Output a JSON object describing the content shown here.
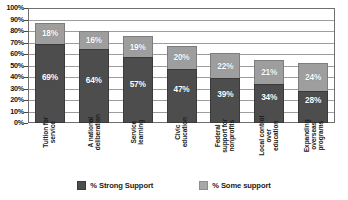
{
  "chart_data": {
    "type": "bar",
    "subtype": "stacked-column",
    "title": "",
    "xlabel": "",
    "ylabel": "",
    "ylim": [
      0,
      100
    ],
    "yticks": [
      "0%",
      "10%",
      "20%",
      "30%",
      "40%",
      "50%",
      "60%",
      "70%",
      "80%",
      "90%",
      "100%"
    ],
    "ytick_values": [
      0,
      10,
      20,
      30,
      40,
      50,
      60,
      70,
      80,
      90,
      100
    ],
    "grid": true,
    "legend_position": "bottom",
    "categories": [
      "Tuition for service",
      "A national deliberation",
      "Service learning",
      "Civic education",
      "Federal support for nonprofits",
      "Local control over education",
      "Expanding overseas programs"
    ],
    "category_lines": [
      [
        "Tuition for",
        "service"
      ],
      [
        "A national",
        "deliberation"
      ],
      [
        "Service",
        "learning"
      ],
      [
        "Civic",
        "education"
      ],
      [
        "Federal",
        "support for",
        "nonprofits"
      ],
      [
        "Local control",
        "over",
        "education"
      ],
      [
        "Expanding",
        "overseas",
        "programs"
      ]
    ],
    "series": [
      {
        "name": "% Strong Support",
        "color": "#4d4d4d",
        "values": [
          69,
          64,
          57,
          47,
          39,
          34,
          28
        ],
        "labels": [
          "69%",
          "64%",
          "57%",
          "47%",
          "39%",
          "34%",
          "28%"
        ]
      },
      {
        "name": "% Some support",
        "color": "#9e9e9e",
        "values": [
          18,
          16,
          19,
          20,
          22,
          21,
          24
        ],
        "labels": [
          "18%",
          "16%",
          "19%",
          "20%",
          "22%",
          "21%",
          "24%"
        ]
      }
    ]
  },
  "legend": {
    "items": [
      {
        "label": "% Strong Support",
        "swatch": "strong"
      },
      {
        "label": "% Some support",
        "swatch": "some"
      }
    ]
  }
}
